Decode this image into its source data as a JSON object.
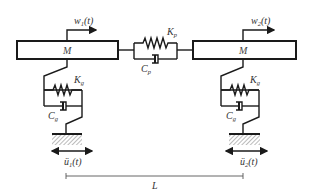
{
  "diagram": {
    "masses": [
      {
        "label": "M",
        "displacement": {
          "symbol": "w",
          "sub": "1",
          "arg": "(t)"
        }
      },
      {
        "label": "M",
        "displacement": {
          "symbol": "w",
          "sub": "2",
          "arg": "(t)"
        }
      }
    ],
    "coupling": {
      "spring": {
        "symbol": "K",
        "sub": "p"
      },
      "damper": {
        "symbol": "C",
        "sub": "p"
      }
    },
    "supports": [
      {
        "spring": {
          "symbol": "K",
          "sub": "g"
        },
        "damper": {
          "symbol": "C",
          "sub": "g"
        },
        "ground_motion": {
          "symbol": "ü",
          "sub": "1",
          "arg": "(t)"
        }
      },
      {
        "spring": {
          "symbol": "K",
          "sub": "g"
        },
        "damper": {
          "symbol": "C",
          "sub": "g"
        },
        "ground_motion": {
          "symbol": "ü",
          "sub": "2",
          "arg": "(t)"
        }
      }
    ],
    "span": {
      "label": "L"
    }
  }
}
